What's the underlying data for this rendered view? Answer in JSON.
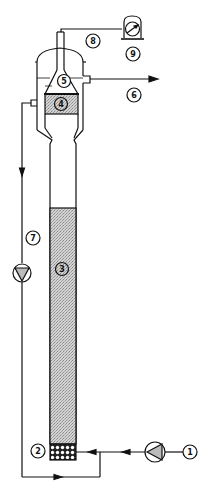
{
  "diagram": {
    "colors": {
      "line": "#111111",
      "fill": "#c8c8c8",
      "background": "#ffffff"
    },
    "labels": [
      {
        "id": "1",
        "text": "1",
        "desc": "feed inlet"
      },
      {
        "id": "2",
        "text": "2",
        "desc": "gas distributor"
      },
      {
        "id": "3",
        "text": "3",
        "desc": "fluidized bed"
      },
      {
        "id": "4",
        "text": "4",
        "desc": "separation zone"
      },
      {
        "id": "5",
        "text": "5",
        "desc": "settling cone"
      },
      {
        "id": "6",
        "text": "6",
        "desc": "product outlet"
      },
      {
        "id": "7",
        "text": "7",
        "desc": "recycle pump"
      },
      {
        "id": "8",
        "text": "8",
        "desc": "pressure line"
      },
      {
        "id": "9",
        "text": "9",
        "desc": "pressure gauge"
      }
    ]
  }
}
